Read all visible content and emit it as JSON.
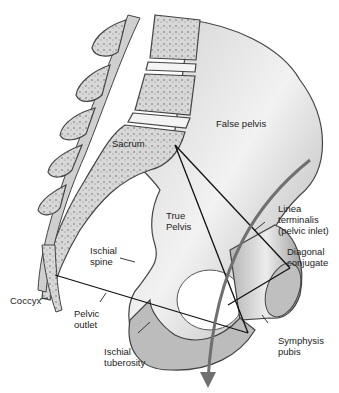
{
  "figure": {
    "labels": {
      "false_pelvis": "False pelvis",
      "sacrum": "Sacrum",
      "true_pelvis": "True\nPelvis",
      "linea_terminalis": "Linea\nterminalis\n(pelvic inlet)",
      "diagonal_conjugate": "Diagonal\nconjugate",
      "ischial_spine": "Ischial\nspine",
      "coccyx": "Coccyx",
      "pelvic_outlet": "Pelvic\noutlet",
      "ischial_tuberosity": "Ischial\ntuberosity",
      "symphysis_pubis": "Symphysis\npubis"
    },
    "colors": {
      "bone_light": "#e6e6e6",
      "bone_mid": "#bdbdbd",
      "bone_dark": "#8a8a8a",
      "outline": "#3a3a3a",
      "line": "#111111",
      "arrow": "#707070"
    }
  }
}
